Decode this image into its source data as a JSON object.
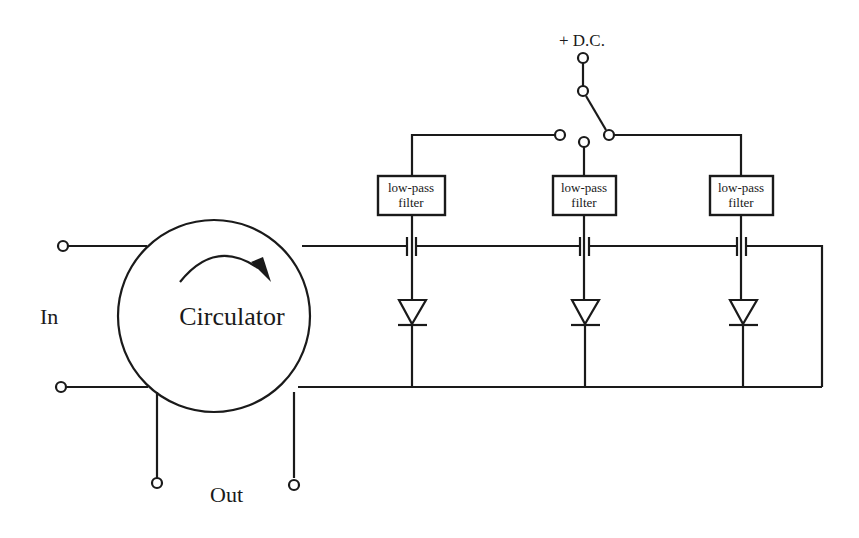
{
  "diagram": {
    "type": "circuit-schematic",
    "labels": {
      "dc_supply": "+ D.C.",
      "input": "In",
      "output": "Out",
      "circulator": "Circulator"
    },
    "filters": [
      {
        "line1": "low-pass",
        "line2": "filter"
      },
      {
        "line1": "low-pass",
        "line2": "filter"
      },
      {
        "line1": "low-pass",
        "line2": "filter"
      }
    ],
    "components": {
      "circulator_count": 1,
      "diodes": 3,
      "capacitors": 3,
      "low_pass_filters": 3,
      "switch_positions": 3
    },
    "colors": {
      "line": "#1a1a1a",
      "background": "#ffffff"
    }
  }
}
